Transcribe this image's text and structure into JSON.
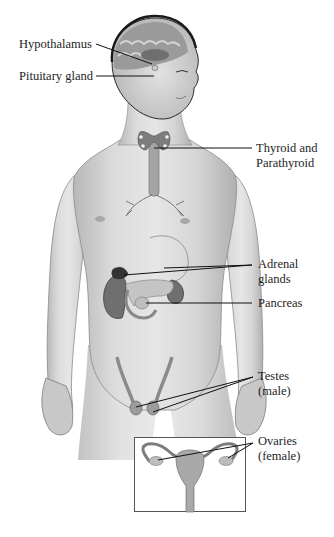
{
  "diagram": {
    "colors": {
      "skin": "#d8d8d8",
      "skin_shadow": "#a9a9a9",
      "organ_dark": "#7a7a7a",
      "organ_mid": "#9d9d9d",
      "leader_line": "#111111",
      "brain": "#8f8f8f"
    },
    "labels": {
      "hypothalamus": "Hypothalamus",
      "pituitary": "Pituitary gland",
      "thyroid_line1": "Thyroid and",
      "thyroid_line2": "Parathyroid",
      "adrenal_line1": "Adrenal",
      "adrenal_line2": "glands",
      "pancreas": "Pancreas",
      "testes_line1": "Testes",
      "testes_line2": "(male)",
      "ovaries_line1": "Ovaries",
      "ovaries_line2": "(female)"
    },
    "inset": {
      "subject": "female reproductive organs (uterus, fallopian tubes, ovaries)"
    }
  }
}
